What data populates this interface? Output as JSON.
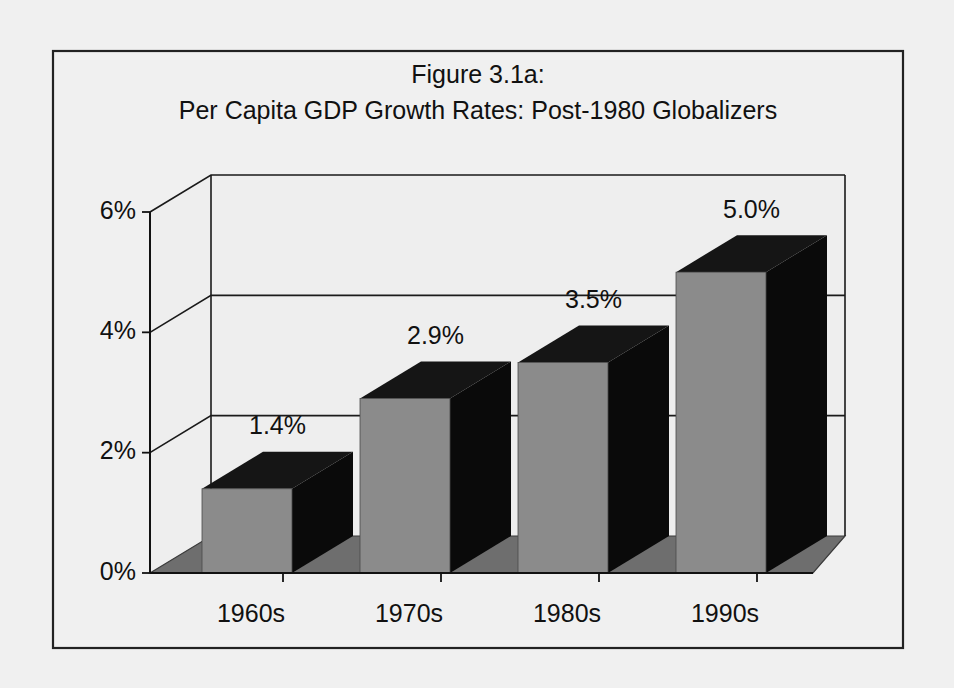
{
  "figure": {
    "title_lines": [
      "Figure 3.1a:",
      "Per Capita GDP Growth Rates: Post-1980 Globalizers"
    ],
    "background_color": "#f0f0f0",
    "border_color": "#222222"
  },
  "chart_data": {
    "type": "bar",
    "title": "Figure 3.1a: Per Capita GDP Growth Rates: Post-1980 Globalizers",
    "categories": [
      "1960s",
      "1970s",
      "1980s",
      "1990s"
    ],
    "values": [
      1.4,
      2.9,
      3.5,
      5.0
    ],
    "data_labels": [
      "1.4%",
      "2.9%",
      "3.5%",
      "5.0%"
    ],
    "xlabel": "",
    "ylabel": "",
    "ylim": [
      0,
      6
    ],
    "ytick_values": [
      0,
      2,
      4,
      6
    ],
    "ytick_labels": [
      "0%",
      "2%",
      "4%",
      "6%"
    ],
    "grid": true,
    "legend": "none",
    "style": "3d-column",
    "colors": {
      "bar_front": "#8b8b8b",
      "bar_side": "#0a0a0a",
      "bar_top": "#151515",
      "floor": "#6e6e6e",
      "wall": "#eeeeee",
      "gridline": "#1a1a1a",
      "text": "#111111"
    }
  }
}
